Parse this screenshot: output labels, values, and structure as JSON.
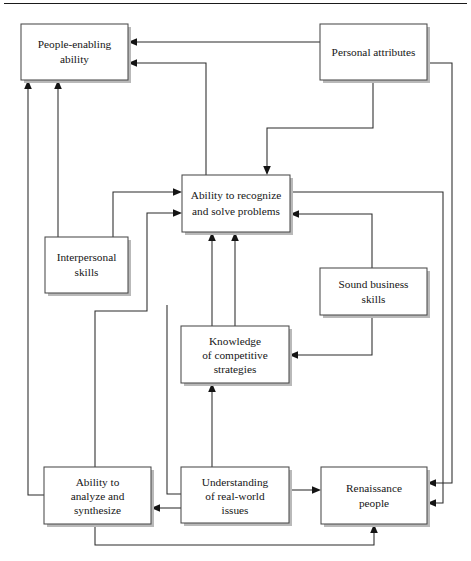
{
  "figure": {
    "type": "flow-diagram",
    "background_color": "#ffffff",
    "line_color": "#2b2b2b",
    "box_border_color": "#4a4a4a",
    "text_color": "#161616",
    "top_rule": true
  },
  "nodes": [
    {
      "id": "people-enabling-ability",
      "lines": [
        "People-enabling",
        "ability"
      ],
      "x": 21,
      "y": 24,
      "w": 107,
      "h": 56
    },
    {
      "id": "personal-attributes",
      "lines": [
        "Personal attributes"
      ],
      "x": 320,
      "y": 24,
      "w": 107,
      "h": 56
    },
    {
      "id": "ability-to-recognize-and-solve-problems",
      "lines": [
        "Ability to recognize",
        "and solve problems"
      ],
      "x": 182,
      "y": 175,
      "w": 108,
      "h": 57
    },
    {
      "id": "interpersonal-skills",
      "lines": [
        "Interpersonal",
        "skills"
      ],
      "x": 45,
      "y": 237,
      "w": 83,
      "h": 56
    },
    {
      "id": "sound-business-skills",
      "lines": [
        "Sound business",
        "skills"
      ],
      "x": 320,
      "y": 268,
      "w": 107,
      "h": 47
    },
    {
      "id": "knowledge-of-competitive-strategies",
      "lines": [
        "Knowledge",
        "of competitive",
        "strategies"
      ],
      "x": 181,
      "y": 326,
      "w": 108,
      "h": 57
    },
    {
      "id": "ability-to-analyze-and-synthesize",
      "lines": [
        "Ability to",
        "analyze and",
        "synthesize"
      ],
      "x": 44,
      "y": 467,
      "w": 107,
      "h": 57
    },
    {
      "id": "understanding-of-real-world-issues",
      "lines": [
        "Understanding",
        "of real-world",
        "issues"
      ],
      "x": 181,
      "y": 467,
      "w": 108,
      "h": 56
    },
    {
      "id": "renaissance-people",
      "lines": [
        "Renaissance",
        "people"
      ],
      "x": 321,
      "y": 467,
      "w": 106,
      "h": 57
    }
  ],
  "edges": [
    {
      "id": "personal-attributes-to-people-enabling-ability",
      "from": "personal-attributes",
      "to": "people-enabling-ability"
    },
    {
      "id": "personal-attributes-to-ability-to-recognize",
      "from": "personal-attributes",
      "to": "ability-to-recognize-and-solve-problems"
    },
    {
      "id": "personal-attributes-to-renaissance-people",
      "from": "personal-attributes",
      "to": "renaissance-people"
    },
    {
      "id": "ability-to-recognize-to-people-enabling-ability",
      "from": "ability-to-recognize-and-solve-problems",
      "to": "people-enabling-ability"
    },
    {
      "id": "ability-to-recognize-to-renaissance-people",
      "from": "ability-to-recognize-and-solve-problems",
      "to": "renaissance-people"
    },
    {
      "id": "interpersonal-skills-to-people-enabling-ability",
      "from": "interpersonal-skills",
      "to": "people-enabling-ability"
    },
    {
      "id": "interpersonal-skills-to-ability-to-recognize",
      "from": "interpersonal-skills",
      "to": "ability-to-recognize-and-solve-problems"
    },
    {
      "id": "ability-to-analyze-to-people-enabling-ability",
      "from": "ability-to-analyze-and-synthesize",
      "to": "people-enabling-ability"
    },
    {
      "id": "ability-to-analyze-to-ability-to-recognize",
      "from": "ability-to-analyze-and-synthesize",
      "to": "ability-to-recognize-and-solve-problems"
    },
    {
      "id": "ability-to-analyze-to-renaissance-people",
      "from": "ability-to-analyze-and-synthesize",
      "to": "renaissance-people"
    },
    {
      "id": "sound-business-skills-to-ability-to-recognize",
      "from": "sound-business-skills",
      "to": "ability-to-recognize-and-solve-problems"
    },
    {
      "id": "sound-business-skills-to-knowledge-of-competitive-strategies",
      "from": "sound-business-skills",
      "to": "knowledge-of-competitive-strategies"
    },
    {
      "id": "knowledge-to-ability-to-recognize",
      "from": "knowledge-of-competitive-strategies",
      "to": "ability-to-recognize-and-solve-problems"
    },
    {
      "id": "understanding-to-knowledge",
      "from": "understanding-of-real-world-issues",
      "to": "knowledge-of-competitive-strategies"
    },
    {
      "id": "understanding-to-ability-to-analyze",
      "from": "understanding-of-real-world-issues",
      "to": "ability-to-analyze-and-synthesize"
    },
    {
      "id": "understanding-to-renaissance-people",
      "from": "understanding-of-real-world-issues",
      "to": "renaissance-people"
    }
  ]
}
